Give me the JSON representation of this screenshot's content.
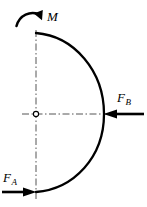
{
  "figure": {
    "kind": "free-body-diagram",
    "background_color": "#ffffff",
    "stroke_color": "#000000",
    "centerline_color": "#4d4d4d",
    "canvas": {
      "width": 147,
      "height": 207
    }
  },
  "geometry": {
    "axis_x": 36,
    "center_y": 114,
    "arc_top_y": 33,
    "arc_bottom_y": 192,
    "arc_right_x": 104,
    "center_marker_radius": 2.6,
    "arc_stroke_width": 2.2,
    "centerline_dash": "7,2.5,1.5,2.5"
  },
  "labels": {
    "moment": {
      "base": "M",
      "sub": ""
    },
    "force_b": {
      "base": "F",
      "sub": "B"
    },
    "force_a": {
      "base": "F",
      "sub": "A"
    }
  },
  "arrows": {
    "moment": {
      "name": "moment-arrow",
      "sense": "clockwise",
      "path": "M 16.5 25.5 C 20.5 14.5 31.0 11.0 39.5 14.5",
      "head_points": "41.5,10.5 42.5,19.0 35.0,14.0",
      "stroke_width": 2.4
    },
    "force_b": {
      "name": "force-b-arrow",
      "direction": "left",
      "tail_x": 144,
      "tip_x": 104,
      "y": 114,
      "shaft_stroke": 2.4,
      "head_points": "104,114 115,110 115,118"
    },
    "force_a": {
      "name": "force-a-arrow",
      "direction": "right",
      "tail_x": 2,
      "tip_x": 36,
      "y": 192,
      "shaft_stroke": 2.4,
      "head_points": "36,192 25,188 25,196"
    }
  },
  "centerlines": {
    "vertical": {
      "x": 36,
      "y1": 30,
      "y2": 200
    },
    "horizontal": {
      "y": 114,
      "x1": 22,
      "x2": 112
    }
  }
}
